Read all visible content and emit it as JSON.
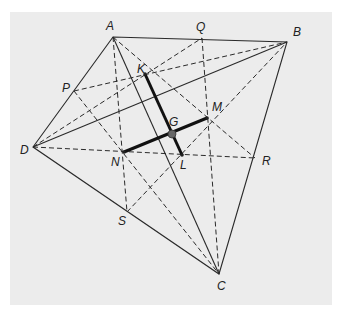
{
  "figure": {
    "type": "geometry-diagram",
    "background_color": "#ececec",
    "points": {
      "A": {
        "label": "A",
        "x": 113,
        "y": 37
      },
      "B": {
        "label": "B",
        "x": 287,
        "y": 42
      },
      "C": {
        "label": "C",
        "x": 219,
        "y": 274
      },
      "D": {
        "label": "D",
        "x": 33,
        "y": 147
      },
      "P": {
        "label": "P",
        "x": 74,
        "y": 91
      },
      "Q": {
        "label": "Q",
        "x": 202,
        "y": 38
      },
      "R": {
        "label": "R",
        "x": 255,
        "y": 158
      },
      "S": {
        "label": "S",
        "x": 127,
        "y": 212
      },
      "K": {
        "label": "K",
        "x": 145,
        "y": 74
      },
      "L": {
        "label": "L",
        "x": 182,
        "y": 155
      },
      "M": {
        "label": "M",
        "x": 207,
        "y": 118
      },
      "N": {
        "label": "N",
        "x": 124,
        "y": 152
      },
      "G": {
        "label": "G",
        "x": 172,
        "y": 134
      }
    },
    "solid_segments": [
      [
        "A",
        "B"
      ],
      [
        "B",
        "C"
      ],
      [
        "C",
        "D"
      ],
      [
        "D",
        "A"
      ],
      [
        "A",
        "C"
      ],
      [
        "B",
        "D"
      ]
    ],
    "thick_segments": [
      [
        "K",
        "L"
      ],
      [
        "N",
        "M"
      ]
    ],
    "dashed_segments": [
      [
        "A",
        "S"
      ],
      [
        "Q",
        "C"
      ],
      [
        "D",
        "Q"
      ],
      [
        "D",
        "R"
      ],
      [
        "P",
        "B"
      ],
      [
        "P",
        "C"
      ],
      [
        "A",
        "R"
      ],
      [
        "S",
        "B"
      ]
    ]
  }
}
